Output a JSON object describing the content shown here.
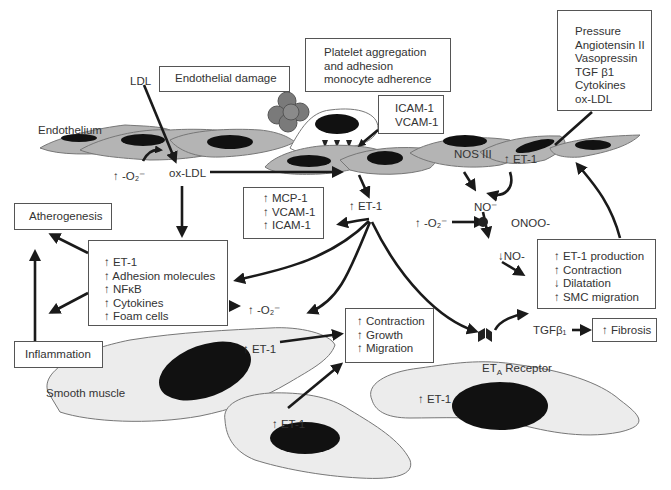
{
  "diagram": {
    "type": "pathway-diagram",
    "colors": {
      "cell_fill_endothelium": "#b4b4b4",
      "cell_fill_smooth_muscle": "#ececec",
      "nucleus": "#111111",
      "platelet": "#7a7a7a",
      "arrow": "#1a1a1a",
      "box_border": "#555555"
    }
  },
  "boxes": {
    "endothelial_damage": "Endothelial damage",
    "platelet": [
      "Platelet aggregation",
      "and adhesion",
      "monocyte adherence"
    ],
    "icam_vcam": [
      "ICAM-1",
      "VCAM-1"
    ],
    "stimuli": [
      "Pressure",
      "Angiotensin II",
      "Vasopressin",
      "TGF β1",
      "Cytokines",
      "ox-LDL"
    ],
    "atherogenesis": "Atherogenesis",
    "inflammation": "Inflammation",
    "mcp": [
      "↑ MCP-1",
      "↑ VCAM-1",
      "↑ ICAM-1"
    ],
    "et1_effects": [
      "↑ ET-1",
      "↑ Adhesion molecules",
      "↑ NFκB",
      "↑ Cytokines",
      "↑ Foam cells"
    ],
    "production": [
      "↑ ET-1 production",
      "↑ Contraction",
      "↓ Dilatation",
      "↑ SMC migration"
    ],
    "contraction": [
      "↑ Contraction",
      "↑ Growth",
      "↑ Migration"
    ],
    "fibrosis": "↑ Fibrosis"
  },
  "labels": {
    "ldl": "LDL",
    "endothelium": "Endothelium",
    "superoxide_left": "↑ -O₂⁻",
    "ox_ldl": "ox-LDL",
    "nos3": "NOS III",
    "et1_endo": "↑ ET-1",
    "et1_center": "↑ ET-1",
    "no_radical": "NO⁻",
    "superoxide_mid": "↑ -O₂⁻",
    "onoo": "ONOO-",
    "no_down": "↓NO-",
    "superoxide_box": "↑ -O₂⁻",
    "tgf": "TGFβ₁",
    "et1_sm_left": "↑ ET-1",
    "et1_sm_bottom": "↑ ET-1",
    "et1_sm_right": "↑ ET-1",
    "smooth_muscle": "Smooth muscle",
    "eta_receptor": "ETA Receptor"
  }
}
